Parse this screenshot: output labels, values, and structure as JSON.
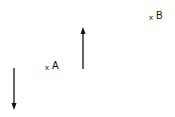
{
  "diagram": {
    "type": "field-vectors-with-points",
    "background": "#ffffff",
    "stroke_color": "#111111",
    "points": [
      {
        "id": "A",
        "marker": "x",
        "label": "A",
        "x": 48,
        "y": 69
      },
      {
        "id": "B",
        "marker": "x",
        "label": "B",
        "x": 152,
        "y": 19
      }
    ],
    "arrows": [
      {
        "id": "down-arrow",
        "direction": "down",
        "x": 14,
        "y_start": 68,
        "y_end": 110
      },
      {
        "id": "up-arrow",
        "direction": "up",
        "x": 83,
        "y_start": 69,
        "y_end": 27
      }
    ]
  }
}
